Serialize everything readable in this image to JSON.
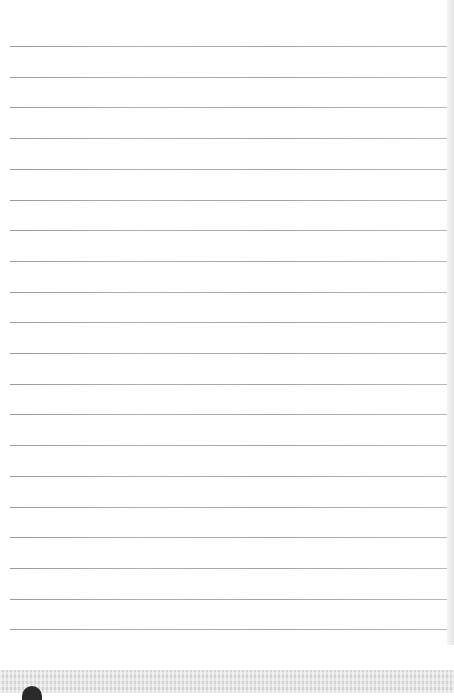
{
  "page": {
    "type": "lined-notebook-page",
    "line_count": 20,
    "first_line_y": 46,
    "line_spacing": 30.7,
    "line_color": "#a6a6a6",
    "background_color": "#fefefe",
    "bottom_band_color": "#e4e4e4"
  }
}
